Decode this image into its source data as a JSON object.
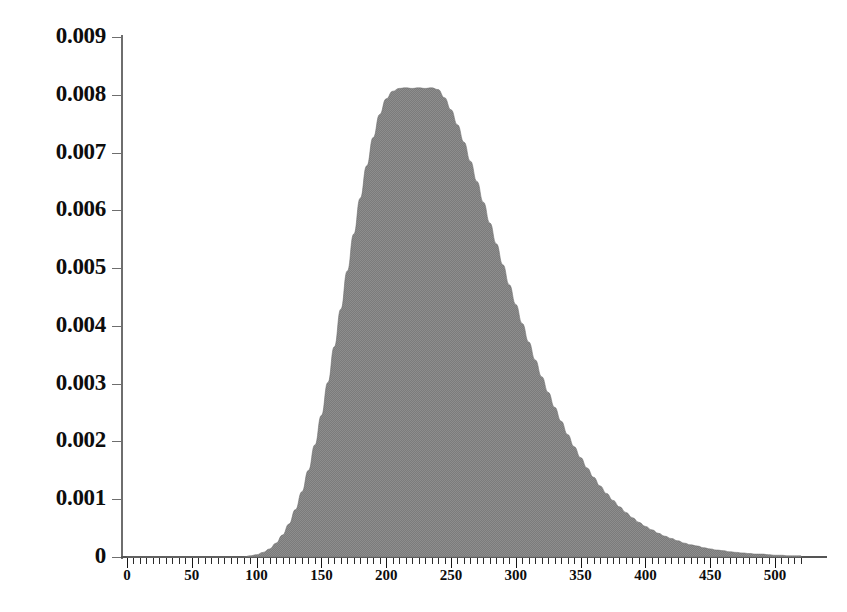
{
  "chart_data": {
    "type": "area",
    "title": "",
    "subtitle": "",
    "xlabel": "",
    "ylabel": "",
    "legend": [],
    "grid": false,
    "xlim": [
      0,
      522
    ],
    "ylim": [
      0,
      0.009
    ],
    "x_tick_labels": [
      "0",
      "50",
      "100",
      "150",
      "200",
      "250",
      "300",
      "350",
      "400",
      "450",
      "500"
    ],
    "x_tick_values": [
      0,
      50,
      100,
      150,
      200,
      250,
      300,
      350,
      400,
      450,
      500
    ],
    "y_tick_labels": [
      "0",
      "0.001",
      "0.002",
      "0.003",
      "0.004",
      "0.005",
      "0.006",
      "0.007",
      "0.008",
      "0.009"
    ],
    "y_tick_values": [
      0,
      0.001,
      0.002,
      0.003,
      0.004,
      0.005,
      0.006,
      0.007,
      0.008,
      0.009
    ],
    "minor_tick_interval": 5,
    "peak": {
      "x": 238,
      "y": 0.00812
    },
    "fill_color": "#808080",
    "line_color": "#6e6e6e",
    "text_color": "#0d0d0d",
    "x": [
      0,
      5,
      10,
      15,
      20,
      25,
      30,
      35,
      40,
      45,
      50,
      55,
      60,
      65,
      70,
      75,
      80,
      85,
      90,
      95,
      100,
      105,
      110,
      115,
      120,
      125,
      130,
      135,
      140,
      145,
      150,
      155,
      160,
      165,
      170,
      175,
      180,
      185,
      190,
      195,
      200,
      205,
      210,
      215,
      220,
      225,
      230,
      235,
      240,
      245,
      250,
      255,
      260,
      265,
      270,
      275,
      280,
      285,
      290,
      295,
      300,
      305,
      310,
      315,
      320,
      325,
      330,
      335,
      340,
      345,
      350,
      355,
      360,
      365,
      370,
      375,
      380,
      385,
      390,
      395,
      400,
      405,
      410,
      415,
      420,
      425,
      430,
      435,
      440,
      445,
      450,
      455,
      460,
      465,
      470,
      475,
      480,
      485,
      490,
      495,
      500,
      505,
      510,
      515,
      520
    ],
    "values": [
      0.0,
      0.0,
      0.0,
      0.0,
      0.0,
      0.0,
      0.0,
      0.0,
      0.0,
      0.0,
      0.0,
      0.0,
      0.0,
      0.0,
      0.0,
      0.0,
      0.0,
      0.0,
      0.0,
      2e-05,
      4e-05,
      8e-05,
      0.00014,
      0.00024,
      0.00038,
      0.00057,
      0.00082,
      0.00113,
      0.0015,
      0.00194,
      0.00245,
      0.00302,
      0.00364,
      0.00429,
      0.00495,
      0.00559,
      0.00621,
      0.00677,
      0.00726,
      0.00766,
      0.00793,
      0.00806,
      0.00811,
      0.00812,
      0.00811,
      0.00812,
      0.00811,
      0.00812,
      0.00809,
      0.00795,
      0.00774,
      0.00748,
      0.00718,
      0.00685,
      0.0065,
      0.00614,
      0.00578,
      0.00542,
      0.00506,
      0.00471,
      0.00437,
      0.00404,
      0.00372,
      0.00341,
      0.00312,
      0.00285,
      0.00259,
      0.00235,
      0.00212,
      0.00191,
      0.00172,
      0.00154,
      0.00138,
      0.00123,
      0.0011,
      0.00098,
      0.00087,
      0.00077,
      0.00068,
      0.0006,
      0.00053,
      0.00047,
      0.00041,
      0.00036,
      0.00032,
      0.00028,
      0.00024,
      0.00021,
      0.00019,
      0.00016,
      0.00014,
      0.00012,
      0.00011,
      9e-05,
      8e-05,
      7e-05,
      6e-05,
      5e-05,
      5e-05,
      4e-05,
      3e-05,
      3e-05,
      2e-05,
      2e-05,
      2e-05
    ]
  }
}
